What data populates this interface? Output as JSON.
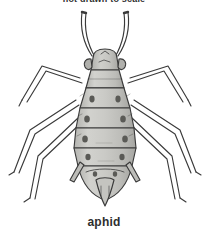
{
  "figure": {
    "subject": "aphid",
    "top_caption": "not drawn to scale",
    "bottom_caption": "aphid",
    "background_color": "#ffffff",
    "ink_color": "#3a3a3a",
    "body_fill_color": "#c8c8c4",
    "body_shadow_color": "#a9a9a5",
    "spot_color": "#5a5a56",
    "caption_color": "#2e2e2e"
  },
  "anatomy": {
    "parts": [
      {
        "name": "antenna-left",
        "label": "antenna"
      },
      {
        "name": "antenna-right",
        "label": "antenna"
      },
      {
        "name": "head",
        "label": "head"
      },
      {
        "name": "eye-left",
        "label": "compound eye"
      },
      {
        "name": "eye-right",
        "label": "compound eye"
      },
      {
        "name": "thorax",
        "label": "thorax"
      },
      {
        "name": "abdomen",
        "label": "abdomen"
      },
      {
        "name": "cornicle-left",
        "label": "siphunculus"
      },
      {
        "name": "cornicle-right",
        "label": "siphunculus"
      },
      {
        "name": "cauda",
        "label": "cauda"
      },
      {
        "name": "foreleg-left",
        "label": "foreleg"
      },
      {
        "name": "foreleg-right",
        "label": "foreleg"
      },
      {
        "name": "midleg-left",
        "label": "midleg"
      },
      {
        "name": "midleg-right",
        "label": "midleg"
      },
      {
        "name": "hindleg-left",
        "label": "hindleg"
      },
      {
        "name": "hindleg-right",
        "label": "hindleg"
      }
    ],
    "abdomen_segment_count": 5,
    "spot_pairs": 5
  }
}
